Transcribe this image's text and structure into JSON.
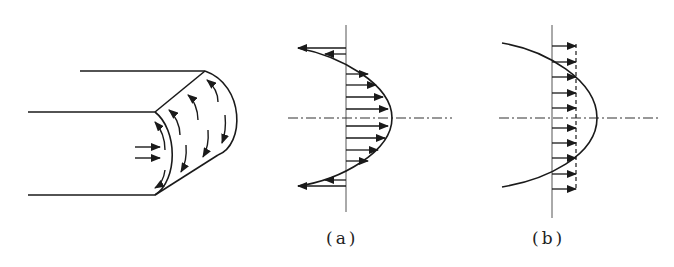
{
  "figure": {
    "panels": [
      {
        "id": "pipe",
        "description": "pipe cross-section with rotating flow arrows"
      },
      {
        "id": "a",
        "label": "(a)",
        "description": "parabolic velocity profile with reverse flow near walls"
      },
      {
        "id": "b",
        "label": "(b)",
        "description": "parabolic profile with uniform (plug) flow arrows"
      }
    ],
    "labels": {
      "a": "(a)",
      "b": "(b)"
    },
    "colors": {
      "stroke": "#1a1a1a",
      "axis": "#555555",
      "background": "#ffffff"
    }
  }
}
